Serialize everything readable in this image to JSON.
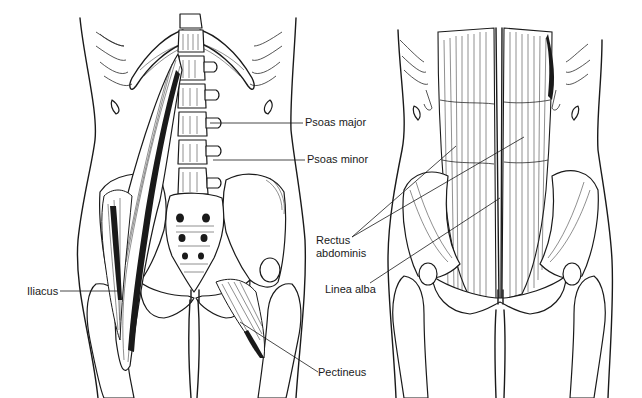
{
  "figure": {
    "panels": [
      {
        "id": "left",
        "view": "deep muscles (psoas / iliacus) anterior view"
      },
      {
        "id": "right",
        "view": "anterior abdominal wall (rectus abdominis)"
      }
    ],
    "colors": {
      "ink": "#1a1a1a",
      "background": "#ffffff"
    }
  },
  "labels": {
    "psoas_major": {
      "text": "Psoas major",
      "x": 305,
      "y": 116,
      "line": [
        210,
        123,
        303,
        123
      ]
    },
    "psoas_minor": {
      "text": "Psoas minor",
      "x": 307,
      "y": 153,
      "line": [
        213,
        160,
        305,
        160
      ]
    },
    "iliacus": {
      "text": "Iliacus",
      "x": 27,
      "y": 285,
      "line": [
        60,
        291,
        120,
        291
      ]
    },
    "pectineus": {
      "text": "Pectineus",
      "x": 318,
      "y": 367,
      "line": [
        240,
        322,
        318,
        372
      ]
    },
    "rectus_abdominis": {
      "text": "Rectus\nabdominis",
      "x": 316,
      "y": 234,
      "line": [
        352,
        237,
        524,
        137
      ]
    },
    "linea_alba": {
      "text": "Linea alba",
      "x": 325,
      "y": 283,
      "line": [
        370,
        283,
        500,
        198
      ]
    }
  }
}
